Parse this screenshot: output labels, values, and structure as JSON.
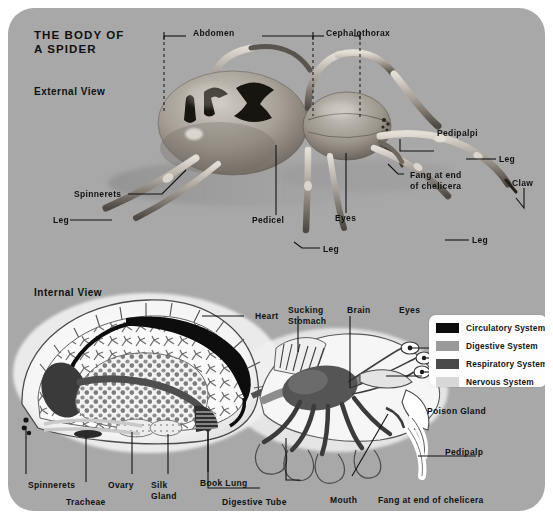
{
  "plate": {
    "title": "THE BODY OF\nA SPIDER",
    "background_color": "#a8a8a8",
    "sections": {
      "external": "External View",
      "internal": "Internal View"
    }
  },
  "external_view": {
    "brackets": [
      {
        "label": "Abdomen"
      },
      {
        "label": "Cephalothorax"
      }
    ],
    "labels": [
      {
        "name": "pedipalpi",
        "text": "Pedipalpi"
      },
      {
        "name": "leg-right-upper",
        "text": "Leg"
      },
      {
        "name": "fang-chelicera",
        "text": "Fang at end\nof chelicera"
      },
      {
        "name": "claw",
        "text": "Claw"
      },
      {
        "name": "leg-right-lower",
        "text": "Leg"
      },
      {
        "name": "spinnerets",
        "text": "Spinnerets"
      },
      {
        "name": "leg-left",
        "text": "Leg"
      },
      {
        "name": "pedicel",
        "text": "Pedicel"
      },
      {
        "name": "eyes",
        "text": "Eyes"
      },
      {
        "name": "leg-center",
        "text": "Leg"
      }
    ]
  },
  "internal_view": {
    "labels": [
      {
        "name": "heart",
        "text": "Heart"
      },
      {
        "name": "sucking-stomach",
        "text": "Sucking\nStomach"
      },
      {
        "name": "brain",
        "text": "Brain"
      },
      {
        "name": "eyes",
        "text": "Eyes"
      },
      {
        "name": "poison-gland",
        "text": "Poison Gland"
      },
      {
        "name": "pedipalp",
        "text": "Pedipalp"
      },
      {
        "name": "spinnerets",
        "text": "Spinnerets"
      },
      {
        "name": "tracheae",
        "text": "Tracheae"
      },
      {
        "name": "ovary",
        "text": "Ovary"
      },
      {
        "name": "silk-gland",
        "text": "Silk\nGland"
      },
      {
        "name": "book-lung",
        "text": "Book Lung"
      },
      {
        "name": "digestive-tube",
        "text": "Digestive Tube"
      },
      {
        "name": "mouth",
        "text": "Mouth"
      },
      {
        "name": "fang-chelicera",
        "text": "Fang at end of chelicera"
      }
    ]
  },
  "legend": {
    "items": [
      {
        "label": "Circulatory System",
        "color": "#0d0d0d"
      },
      {
        "label": "Digestive System",
        "color": "#9a9a9a"
      },
      {
        "label": "Respiratory System",
        "color": "#4a4a4a"
      },
      {
        "label": "Nervous System",
        "color": "#d8d8d8"
      }
    ]
  }
}
